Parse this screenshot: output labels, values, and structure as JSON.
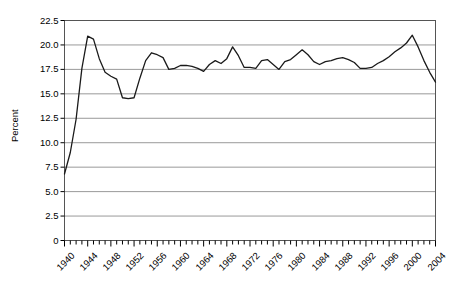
{
  "chart_data": {
    "type": "line",
    "title": "",
    "xlabel": "",
    "ylabel": "Percent",
    "xlim": [
      1940,
      2004
    ],
    "ylim": [
      0,
      22.5
    ],
    "grid": "horizontal",
    "legend": "none",
    "y_ticks": [
      "22.5",
      "20.0",
      "17.5",
      "15.0",
      "12.5",
      "10.0",
      "7.5",
      "5.0",
      "2.5",
      "0"
    ],
    "y_tick_values": [
      22.5,
      20.0,
      17.5,
      15.0,
      12.5,
      10.0,
      7.5,
      5.0,
      2.5,
      0
    ],
    "x_ticks": [
      "1940",
      "1944",
      "1948",
      "1952",
      "1956",
      "1960",
      "1964",
      "1968",
      "1972",
      "1976",
      "1980",
      "1984",
      "1988",
      "1992",
      "1996",
      "2000",
      "2004"
    ],
    "x_tick_values": [
      1940,
      1944,
      1948,
      1952,
      1956,
      1960,
      1964,
      1968,
      1972,
      1976,
      1980,
      1984,
      1988,
      1992,
      1996,
      2000,
      2004
    ],
    "x_minor_tick_interval": 1,
    "line_color": "#1a1a1a",
    "grid_color": "#999999",
    "axis_color": "#555555",
    "series": [
      {
        "name": "Percent",
        "x": [
          1940,
          1941,
          1942,
          1943,
          1944,
          1945,
          1946,
          1947,
          1948,
          1949,
          1950,
          1951,
          1952,
          1953,
          1954,
          1955,
          1956,
          1957,
          1958,
          1959,
          1960,
          1961,
          1962,
          1963,
          1964,
          1965,
          1966,
          1967,
          1968,
          1969,
          1970,
          1971,
          1972,
          1973,
          1974,
          1975,
          1976,
          1977,
          1978,
          1979,
          1980,
          1981,
          1982,
          1983,
          1984,
          1985,
          1986,
          1987,
          1988,
          1989,
          1990,
          1991,
          1992,
          1993,
          1994,
          1995,
          1996,
          1997,
          1998,
          1999,
          2000,
          2001,
          2002,
          2003,
          2004
        ],
        "values": [
          6.8,
          9.0,
          12.4,
          17.6,
          20.9,
          20.6,
          18.6,
          17.2,
          16.8,
          16.5,
          14.6,
          14.5,
          14.6,
          16.6,
          18.4,
          19.2,
          19.0,
          18.7,
          17.5,
          17.6,
          17.9,
          17.9,
          17.8,
          17.6,
          17.3,
          18.0,
          18.4,
          18.1,
          18.6,
          19.8,
          18.9,
          17.7,
          17.7,
          17.6,
          18.4,
          18.5,
          18.0,
          17.5,
          18.3,
          18.5,
          19.0,
          19.5,
          19.0,
          18.3,
          18.0,
          18.3,
          18.4,
          18.6,
          18.7,
          18.5,
          18.2,
          17.6,
          17.6,
          17.7,
          18.1,
          18.4,
          18.8,
          19.3,
          19.7,
          20.2,
          21.0,
          19.8,
          18.4,
          17.2,
          16.2
        ]
      }
    ]
  }
}
